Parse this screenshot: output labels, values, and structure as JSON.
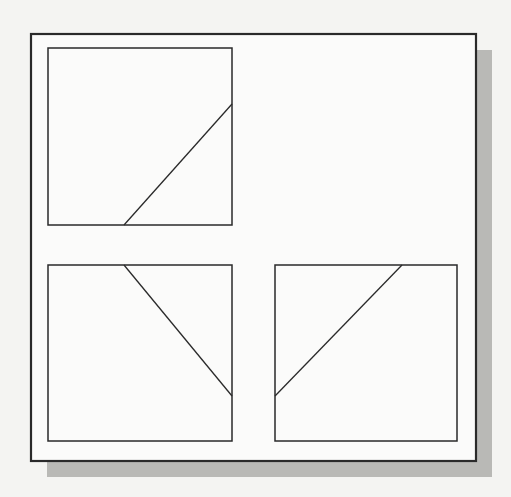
{
  "canvas": {
    "width": 511,
    "height": 497,
    "background": "#f4f4f2"
  },
  "colors": {
    "stroke": "#2a2a2a",
    "panel_fill": "#fbfbfa",
    "shadow": "#b9b9b6"
  },
  "frame": {
    "x": 31,
    "y": 34,
    "w": 445,
    "h": 427,
    "stroke_width": 2.2,
    "shadow_offset": 16
  },
  "panels": [
    {
      "name": "panel-top-left",
      "x": 48,
      "y": 48,
      "w": 184,
      "h": 177,
      "line": {
        "x1": 124,
        "y1": 225,
        "x2": 232,
        "y2": 104
      }
    },
    {
      "name": "panel-bottom-left",
      "x": 48,
      "y": 265,
      "w": 184,
      "h": 176,
      "line": {
        "x1": 124,
        "y1": 265,
        "x2": 232,
        "y2": 396
      }
    },
    {
      "name": "panel-bottom-right",
      "x": 275,
      "y": 265,
      "w": 182,
      "h": 176,
      "line": {
        "x1": 275,
        "y1": 396,
        "x2": 402,
        "y2": 265
      }
    }
  ]
}
